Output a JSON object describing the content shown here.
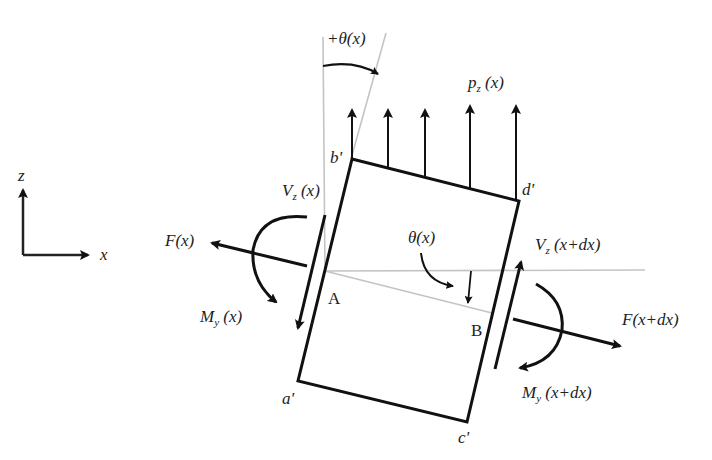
{
  "diagram": {
    "axes": {
      "z_label": "z",
      "x_label": "x"
    },
    "corners": {
      "a": "a'",
      "b": "b'",
      "c": "c'",
      "d": "d'"
    },
    "points": {
      "A": "A",
      "B": "B"
    },
    "labels": {
      "theta_plus": "+θ(x)",
      "theta": "θ(x)",
      "pz_main": "p",
      "pz_sub": "z",
      "pz_arg": " (x)",
      "vz_left_main": "V",
      "vz_left_sub": "z",
      "vz_left_arg": " (x)",
      "vz_right_main": "V",
      "vz_right_sub": "z",
      "vz_right_arg": " (x+dx)",
      "my_left_main": "M",
      "my_left_sub": "y",
      "my_left_arg": " (x)",
      "my_right_main": "M",
      "my_right_sub": "y",
      "my_right_arg": " (x+dx)",
      "f_left": "F(x)",
      "f_right": "F(x+dx)"
    },
    "colors": {
      "stroke": "#111111",
      "guide": "#bbbbbb",
      "text": "#222222"
    }
  }
}
